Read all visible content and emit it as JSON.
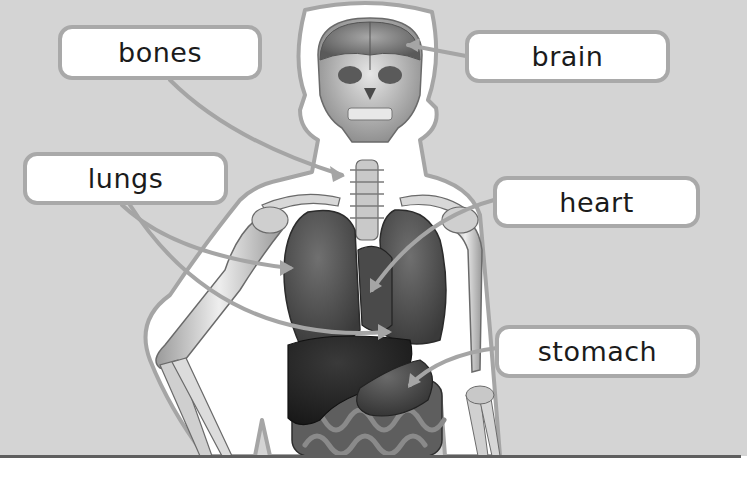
{
  "diagram": {
    "colors": {
      "background": "#d4d4d4",
      "label_fill": "#ffffff",
      "label_border": "#a9a9a9",
      "leader_line": "#a5a5a5",
      "text": "#1b1b1b",
      "bottom_rule": "#5e5e5e"
    },
    "labels": [
      {
        "id": "bones",
        "text": "bones"
      },
      {
        "id": "brain",
        "text": "brain"
      },
      {
        "id": "lungs",
        "text": "lungs"
      },
      {
        "id": "heart",
        "text": "heart"
      },
      {
        "id": "stomach",
        "text": "stomach"
      }
    ]
  }
}
